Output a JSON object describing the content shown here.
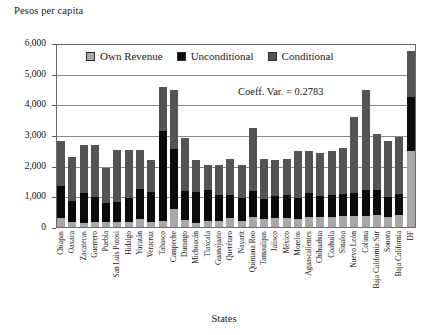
{
  "chart_data": {
    "type": "bar",
    "stacked": true,
    "title": "",
    "ylabel": "Pesos per capita",
    "xlabel": "States",
    "ylim": [
      0,
      6000
    ],
    "yticks": [
      0,
      1000,
      2000,
      3000,
      4000,
      5000,
      6000
    ],
    "ytick_labels": [
      "0",
      "1,000",
      "2,000",
      "3,000",
      "4,000",
      "5,000",
      "6,000"
    ],
    "grid": true,
    "legend_position": "top-inside",
    "annotation": "Coeff. Var. = 0.2783",
    "colors": {
      "own_revenue": "#a8a8a8",
      "unconditional": "#0b0b0b",
      "conditional": "#545454",
      "axis": "#6a6a6a",
      "grid": "#8a8a8a"
    },
    "categories": [
      "Chiapas",
      "Oaxaca",
      "Zacatecas",
      "Guerrero",
      "Puebla",
      "San Luis Potosi",
      "Hidalgo",
      "Yucatán",
      "Veracruz",
      "Tabasco",
      "Campeche",
      "Durango",
      "Michoacán",
      "Tlaxcala",
      "Guanajuato",
      "Querétaro",
      "Nayarit",
      "Quintana Roo",
      "Tamaulipas",
      "Jalisco",
      "México",
      "Morelos",
      "Aguascalientes",
      "Chihuahua",
      "Coahuila",
      "Sinaloa",
      "Nuevo León",
      "Colima",
      "Baja California Sur",
      "Sonora",
      "Baja California",
      "DF"
    ],
    "series": [
      {
        "name": "Own Revenue",
        "color": "#a8a8a8",
        "values": [
          290,
          180,
          140,
          150,
          170,
          155,
          160,
          280,
          160,
          200,
          610,
          240,
          130,
          190,
          200,
          290,
          200,
          330,
          260,
          290,
          300,
          260,
          330,
          330,
          330,
          350,
          370,
          350,
          400,
          320,
          380,
          2500
        ]
      },
      {
        "name": "Unconditional",
        "color": "#0b0b0b",
        "values": [
          1070,
          680,
          980,
          850,
          610,
          670,
          790,
          960,
          980,
          2950,
          1960,
          960,
          1040,
          1030,
          850,
          780,
          770,
          860,
          650,
          720,
          740,
          700,
          790,
          700,
          730,
          750,
          750,
          880,
          820,
          680,
          700,
          1770
        ]
      },
      {
        "name": "Conditional",
        "color": "#545454",
        "values": [
          1490,
          1440,
          1600,
          1720,
          1180,
          1730,
          1600,
          1310,
          1060,
          1470,
          1950,
          1720,
          1040,
          830,
          980,
          1180,
          1080,
          2060,
          1320,
          1210,
          1200,
          1540,
          1400,
          1420,
          1430,
          1510,
          2520,
          3290,
          1850,
          1850,
          1880,
          1530
        ]
      }
    ],
    "totals": [
      2850,
      2300,
      2720,
      2720,
      1960,
      2555,
      2550,
      2550,
      2200,
      4620,
      4520,
      2920,
      2210,
      2050,
      2030,
      2250,
      2050,
      3250,
      2230,
      2220,
      2240,
      2500,
      2520,
      2450,
      2490,
      2610,
      3640,
      4520,
      3070,
      2850,
      2960,
      5800
    ]
  },
  "legend": {
    "items": [
      {
        "label": "Own Revenue"
      },
      {
        "label": "Unconditional"
      },
      {
        "label": "Conditional"
      }
    ]
  }
}
